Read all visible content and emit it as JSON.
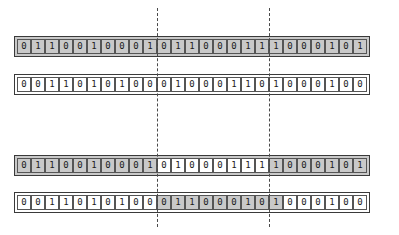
{
  "diagram": {
    "bit_cell_count": 25,
    "colors": {
      "shaded_cell": "#c9c9c9",
      "unshaded_cell": "#ffffff",
      "cell_border": "#555555",
      "strip_border": "#3a3a3a",
      "guide_line": "#4a4a4a"
    },
    "guides": [
      {
        "name": "left-alignment-guide",
        "after_cell_index": 10,
        "style": "dashed"
      },
      {
        "name": "right-alignment-guide",
        "after_cell_index": 18,
        "style": "dashed"
      }
    ],
    "rows": [
      {
        "id": "row-1",
        "name": "sequence-row-upper-first",
        "strip_background": "shaded",
        "bits": [
          "0",
          "1",
          "1",
          "0",
          "0",
          "1",
          "0",
          "0",
          "0",
          "1",
          "0",
          "1",
          "1",
          "0",
          "0",
          "0",
          "1",
          "1",
          "1",
          "0",
          "0",
          "0",
          "1",
          "0",
          "1"
        ],
        "shading": [
          "dark",
          "dark",
          "dark",
          "dark",
          "dark",
          "dark",
          "dark",
          "dark",
          "dark",
          "dark",
          "dark",
          "dark",
          "dark",
          "dark",
          "dark",
          "dark",
          "dark",
          "dark",
          "dark",
          "dark",
          "dark",
          "dark",
          "dark",
          "dark",
          "dark"
        ]
      },
      {
        "id": "row-2",
        "name": "sequence-row-upper-second",
        "strip_background": "plain",
        "bits": [
          "0",
          "0",
          "1",
          "1",
          "0",
          "1",
          "0",
          "1",
          "0",
          "0",
          "0",
          "1",
          "0",
          "0",
          "0",
          "1",
          "1",
          "0",
          "1",
          "0",
          "0",
          "0",
          "1",
          "0",
          "0"
        ],
        "shading": [
          "light",
          "light",
          "light",
          "light",
          "light",
          "light",
          "light",
          "light",
          "light",
          "light",
          "light",
          "light",
          "light",
          "light",
          "light",
          "light",
          "light",
          "light",
          "light",
          "light",
          "light",
          "light",
          "light",
          "light",
          "light"
        ]
      },
      {
        "id": "row-3",
        "name": "sequence-row-lower-first",
        "strip_background": "shaded",
        "bits": [
          "0",
          "1",
          "1",
          "0",
          "0",
          "1",
          "0",
          "0",
          "0",
          "1",
          "0",
          "1",
          "0",
          "0",
          "0",
          "1",
          "1",
          "1",
          "1",
          "0",
          "0",
          "0",
          "1",
          "0",
          "1"
        ],
        "shading": [
          "dark",
          "dark",
          "dark",
          "dark",
          "dark",
          "dark",
          "dark",
          "dark",
          "dark",
          "dark",
          "light",
          "light",
          "light",
          "light",
          "light",
          "light",
          "light",
          "light",
          "dark",
          "dark",
          "dark",
          "dark",
          "dark",
          "dark",
          "dark"
        ]
      },
      {
        "id": "row-4",
        "name": "sequence-row-lower-second",
        "strip_background": "plain",
        "bits": [
          "0",
          "0",
          "1",
          "1",
          "0",
          "1",
          "0",
          "1",
          "0",
          "0",
          "0",
          "1",
          "1",
          "0",
          "0",
          "0",
          "1",
          "0",
          "1",
          "0",
          "0",
          "0",
          "1",
          "0",
          "0"
        ],
        "shading": [
          "light",
          "light",
          "light",
          "light",
          "light",
          "light",
          "light",
          "light",
          "light",
          "light",
          "dark",
          "dark",
          "dark",
          "dark",
          "dark",
          "dark",
          "dark",
          "dark",
          "dark",
          "light",
          "light",
          "light",
          "light",
          "light",
          "light"
        ]
      }
    ]
  }
}
